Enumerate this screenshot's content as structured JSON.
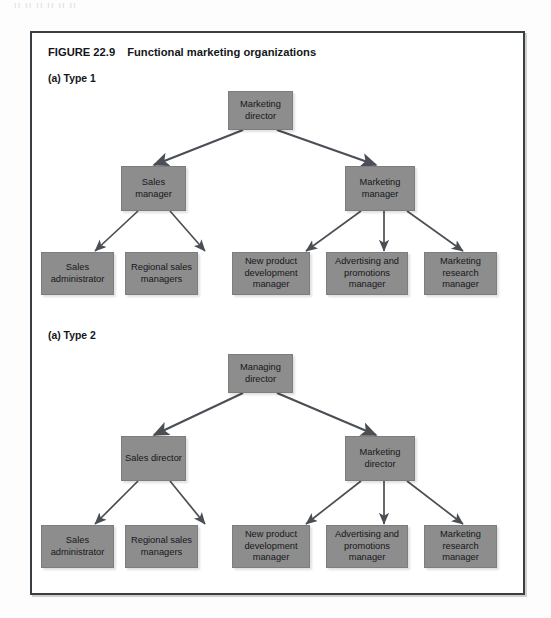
{
  "figure": {
    "number": "FIGURE 22.9",
    "title": "Functional marketing organizations",
    "bleed_text": "ıı ıı  ıı ıı    ıı ıı"
  },
  "diagrams": [
    {
      "label": "(a) Type 1",
      "levels": {
        "top": "Marketing director",
        "mid_left": "Sales manager",
        "mid_right": "Marketing manager",
        "leaves": [
          "Sales administrator",
          "Regional sales managers",
          "New product development manager",
          "Advertising and promotions manager",
          "Marketing research manager"
        ]
      }
    },
    {
      "label": "(a) Type 2",
      "levels": {
        "top": "Managing director",
        "mid_left": "Sales director",
        "mid_right": "Marketing director",
        "leaves": [
          "Sales administrator",
          "Regional sales managers",
          "New product development manager",
          "Advertising and promotions manager",
          "Marketing research manager"
        ]
      }
    }
  ],
  "style": {
    "node_fill": "#8d8d8d",
    "frame_border": "#3a3f44",
    "edge_color": "#4a4f55",
    "text_color": "#15171a",
    "page_bg": "#fdfdfd"
  }
}
